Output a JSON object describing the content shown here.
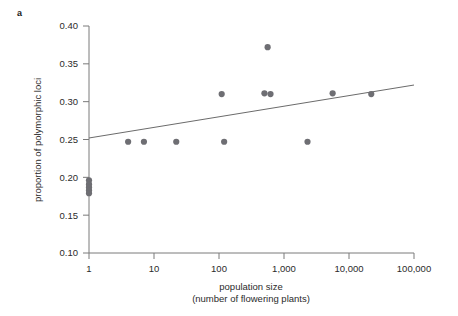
{
  "figure": {
    "panel_label": "a"
  },
  "chart_data": {
    "type": "scatter",
    "title": "",
    "xlabel": "population size",
    "xlabel_line2": "(number of flowering plants)",
    "ylabel": "proportion of polymorphic loci",
    "x_scale": "log",
    "xlim": [
      1,
      100000
    ],
    "ylim": [
      0.1,
      0.4
    ],
    "x_ticks": [
      1,
      10,
      100,
      1000,
      10000,
      100000
    ],
    "x_tick_labels": [
      "1",
      "10",
      "100",
      "1,000",
      "10,000",
      "100,000"
    ],
    "y_ticks": [
      0.1,
      0.15,
      0.2,
      0.25,
      0.3,
      0.35,
      0.4
    ],
    "y_tick_labels": [
      "0.10",
      "0.15",
      "0.20",
      "0.25",
      "0.30",
      "0.35",
      "0.40"
    ],
    "grid": false,
    "legend": null,
    "point_color": "#6e6e73",
    "line_color": "#6b6b6b",
    "points": [
      {
        "x": 1,
        "y": 0.196
      },
      {
        "x": 1,
        "y": 0.191
      },
      {
        "x": 1,
        "y": 0.187
      },
      {
        "x": 1,
        "y": 0.183
      },
      {
        "x": 1,
        "y": 0.179
      },
      {
        "x": 4,
        "y": 0.247
      },
      {
        "x": 7,
        "y": 0.247
      },
      {
        "x": 22,
        "y": 0.247
      },
      {
        "x": 120,
        "y": 0.247
      },
      {
        "x": 110,
        "y": 0.31
      },
      {
        "x": 500,
        "y": 0.311
      },
      {
        "x": 620,
        "y": 0.31
      },
      {
        "x": 560,
        "y": 0.372
      },
      {
        "x": 2300,
        "y": 0.247
      },
      {
        "x": 5600,
        "y": 0.311
      },
      {
        "x": 22000,
        "y": 0.31
      }
    ],
    "trend_line": {
      "x_start": 1,
      "y_start": 0.252,
      "x_end": 100000,
      "y_end": 0.322
    }
  }
}
